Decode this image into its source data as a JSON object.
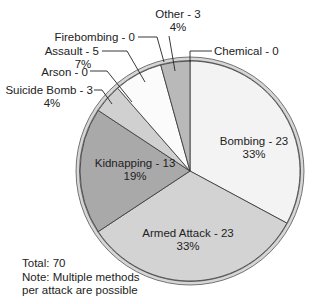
{
  "chart_data": {
    "type": "pie",
    "title": "",
    "start_angle_deg": 0,
    "direction": "clockwise",
    "total": 70,
    "slices": [
      {
        "label": "Bombing",
        "value": 23,
        "percent": "33%",
        "color": "#f3f3f3"
      },
      {
        "label": "Armed Attack",
        "value": 23,
        "percent": "33%",
        "color": "#d3d3d3"
      },
      {
        "label": "Kidnapping",
        "value": 13,
        "percent": "19%",
        "color": "#a9a9a9"
      },
      {
        "label": "Suicide Bomb",
        "value": 3,
        "percent": "4%",
        "color": "#d0d0d0"
      },
      {
        "label": "Arson",
        "value": 0,
        "percent": "",
        "color": "#cccccc"
      },
      {
        "label": "Assault",
        "value": 5,
        "percent": "7%",
        "color": "#fbfbfb"
      },
      {
        "label": "Firebombing",
        "value": 0,
        "percent": "",
        "color": "#eeeeee"
      },
      {
        "label": "Other",
        "value": 3,
        "percent": "4%",
        "color": "#b9b9b9"
      },
      {
        "label": "Chemical",
        "value": 0,
        "percent": "",
        "color": "#dddddd"
      }
    ],
    "annotations": [
      "Total: 70",
      "Note: Multiple methods",
      "per attack are possible"
    ]
  },
  "labels": {
    "bombing": {
      "name": "Bombing - 23",
      "pct": "33%"
    },
    "armed_attack": {
      "name": "Armed Attack - 23",
      "pct": "33%"
    },
    "kidnapping": {
      "name": "Kidnapping - 13",
      "pct": "19%"
    },
    "suicide_bomb": {
      "name": "Suicide Bomb - 3",
      "pct": "4%"
    },
    "arson": {
      "name": "Arson - 0"
    },
    "assault": {
      "name": "Assault - 5",
      "pct": "7%"
    },
    "firebombing": {
      "name": "Firebombing - 0"
    },
    "other": {
      "name": "Other - 3",
      "pct": "4%"
    },
    "chemical": {
      "name": "Chemical - 0"
    }
  },
  "footnote": {
    "total": "Total: 70",
    "note_line1": "Note: Multiple methods",
    "note_line2": "per attack are possible"
  }
}
